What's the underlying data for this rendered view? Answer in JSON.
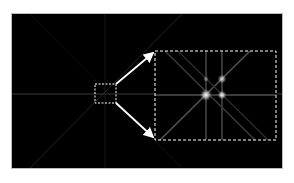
{
  "figure": {
    "type": "fourier-transform-diffraction-pattern",
    "background_color": "#000000",
    "overview_region": {
      "x": 94,
      "y": 84,
      "w": 22,
      "h": 19
    },
    "zoom_inset": {
      "x": 155,
      "y": 51,
      "w": 121,
      "h": 89
    },
    "annotation_color": "#ffffff",
    "spots": [
      {
        "name": "central-peak",
        "cx": 206,
        "cy": 95,
        "r": 4
      },
      {
        "name": "right-peak",
        "cx": 222,
        "cy": 95,
        "r": 3
      },
      {
        "name": "upper-right-peak",
        "cx": 222,
        "cy": 79,
        "r": 3
      },
      {
        "name": "upper-left-peak",
        "cx": 206,
        "cy": 79,
        "r": 2
      }
    ]
  }
}
